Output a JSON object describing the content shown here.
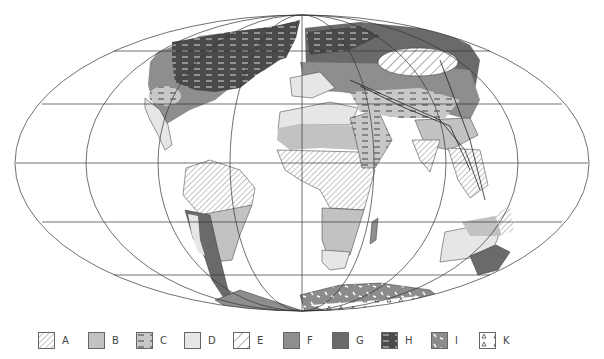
{
  "map": {
    "projection": "mollweide",
    "graticule": {
      "parallels": 5,
      "meridians": 7
    },
    "colors": {
      "outline": "#333333",
      "A_hatch": "#8a8a8a",
      "B": "#c2c2c2",
      "C_base": "#c8c8c8",
      "D": "#e6e6e6",
      "E_hatch": "#555555",
      "F": "#8e8e8e",
      "G": "#6a6a6a",
      "H": "#4a4a4a",
      "I": "#8c8c8c",
      "K": "#ffffff"
    }
  },
  "legend": {
    "items": [
      {
        "key": "A",
        "label": "A",
        "pattern": "fine-hatch"
      },
      {
        "key": "B",
        "label": "B",
        "pattern": "medium-grey"
      },
      {
        "key": "C",
        "label": "C",
        "pattern": "light-grey-dashes"
      },
      {
        "key": "D",
        "label": "D",
        "pattern": "very-light-grey"
      },
      {
        "key": "E",
        "label": "E",
        "pattern": "wide-hatch"
      },
      {
        "key": "F",
        "label": "F",
        "pattern": "grey"
      },
      {
        "key": "G",
        "label": "G",
        "pattern": "dark-grey"
      },
      {
        "key": "H",
        "label": "H",
        "pattern": "dark-dashes"
      },
      {
        "key": "I",
        "label": "I",
        "pattern": "grey-flecks"
      },
      {
        "key": "K",
        "label": "K",
        "pattern": "triangles"
      }
    ]
  }
}
